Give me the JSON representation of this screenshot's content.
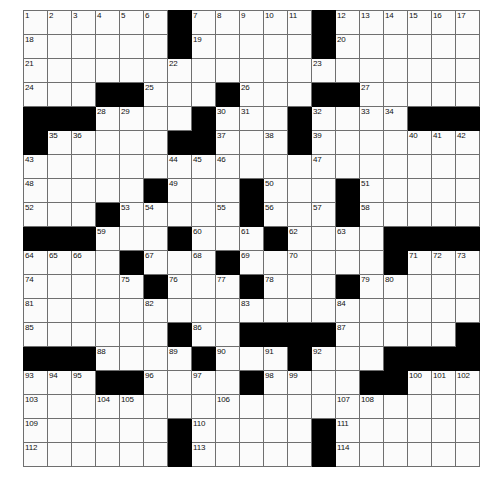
{
  "puzzle": {
    "title": "Crossword Grid",
    "rows": 19,
    "cols": 19,
    "cell_size_px": 23,
    "colors": {
      "block": "#000000",
      "cell": "#fbfbfb",
      "grid_line": "#6f6f6f",
      "number_text": "#111111"
    },
    "highest_number": 114,
    "blocks": [
      [
        1,
        7
      ],
      [
        1,
        13
      ],
      [
        2,
        7
      ],
      [
        2,
        13
      ],
      [
        4,
        4
      ],
      [
        4,
        5
      ],
      [
        4,
        9
      ],
      [
        4,
        13
      ],
      [
        4,
        14
      ],
      [
        5,
        1
      ],
      [
        5,
        2
      ],
      [
        5,
        3
      ],
      [
        5,
        8
      ],
      [
        5,
        12
      ],
      [
        5,
        17
      ],
      [
        5,
        18
      ],
      [
        5,
        19
      ],
      [
        6,
        1
      ],
      [
        6,
        7
      ],
      [
        6,
        8
      ],
      [
        6,
        12
      ],
      [
        8,
        6
      ],
      [
        8,
        10
      ],
      [
        8,
        14
      ],
      [
        9,
        4
      ],
      [
        9,
        10
      ],
      [
        9,
        14
      ],
      [
        10,
        1
      ],
      [
        10,
        2
      ],
      [
        10,
        3
      ],
      [
        10,
        7
      ],
      [
        10,
        11
      ],
      [
        10,
        16
      ],
      [
        10,
        17
      ],
      [
        10,
        18
      ],
      [
        10,
        19
      ],
      [
        11,
        5
      ],
      [
        11,
        9
      ],
      [
        11,
        16
      ],
      [
        12,
        6
      ],
      [
        12,
        10
      ],
      [
        12,
        14
      ],
      [
        14,
        7
      ],
      [
        14,
        10
      ],
      [
        14,
        11
      ],
      [
        14,
        12
      ],
      [
        14,
        13
      ],
      [
        14,
        19
      ],
      [
        15,
        1
      ],
      [
        15,
        2
      ],
      [
        15,
        3
      ],
      [
        15,
        8
      ],
      [
        15,
        12
      ],
      [
        15,
        16
      ],
      [
        15,
        17
      ],
      [
        15,
        18
      ],
      [
        15,
        19
      ],
      [
        16,
        4
      ],
      [
        16,
        5
      ],
      [
        16,
        10
      ],
      [
        16,
        15
      ],
      [
        16,
        16
      ],
      [
        18,
        7
      ],
      [
        18,
        13
      ],
      [
        19,
        7
      ],
      [
        19,
        13
      ]
    ],
    "numbers": [
      {
        "n": 1,
        "row": 1,
        "col": 1
      },
      {
        "n": 2,
        "row": 1,
        "col": 2
      },
      {
        "n": 3,
        "row": 1,
        "col": 3
      },
      {
        "n": 4,
        "row": 1,
        "col": 4
      },
      {
        "n": 5,
        "row": 1,
        "col": 5
      },
      {
        "n": 6,
        "row": 1,
        "col": 6
      },
      {
        "n": 7,
        "row": 1,
        "col": 8
      },
      {
        "n": 8,
        "row": 1,
        "col": 9
      },
      {
        "n": 9,
        "row": 1,
        "col": 10
      },
      {
        "n": 10,
        "row": 1,
        "col": 11
      },
      {
        "n": 11,
        "row": 1,
        "col": 12
      },
      {
        "n": 12,
        "row": 1,
        "col": 14
      },
      {
        "n": 13,
        "row": 1,
        "col": 15
      },
      {
        "n": 14,
        "row": 1,
        "col": 16
      },
      {
        "n": 15,
        "row": 1,
        "col": 17
      },
      {
        "n": 16,
        "row": 1,
        "col": 18
      },
      {
        "n": 17,
        "row": 1,
        "col": 19
      },
      {
        "n": 18,
        "row": 2,
        "col": 1
      },
      {
        "n": 19,
        "row": 2,
        "col": 8
      },
      {
        "n": 20,
        "row": 2,
        "col": 14
      },
      {
        "n": 21,
        "row": 3,
        "col": 1
      },
      {
        "n": 22,
        "row": 3,
        "col": 7
      },
      {
        "n": 23,
        "row": 3,
        "col": 13
      },
      {
        "n": 24,
        "row": 4,
        "col": 1
      },
      {
        "n": 25,
        "row": 4,
        "col": 6
      },
      {
        "n": 26,
        "row": 4,
        "col": 10
      },
      {
        "n": 27,
        "row": 4,
        "col": 15
      },
      {
        "n": 28,
        "row": 5,
        "col": 4
      },
      {
        "n": 29,
        "row": 5,
        "col": 5
      },
      {
        "n": 30,
        "row": 5,
        "col": 9
      },
      {
        "n": 31,
        "row": 5,
        "col": 10
      },
      {
        "n": 32,
        "row": 5,
        "col": 13
      },
      {
        "n": 33,
        "row": 5,
        "col": 15
      },
      {
        "n": 34,
        "row": 5,
        "col": 16
      },
      {
        "n": 35,
        "row": 6,
        "col": 2
      },
      {
        "n": 36,
        "row": 6,
        "col": 3
      },
      {
        "n": 37,
        "row": 6,
        "col": 9
      },
      {
        "n": 38,
        "row": 6,
        "col": 11
      },
      {
        "n": 39,
        "row": 6,
        "col": 13
      },
      {
        "n": 40,
        "row": 6,
        "col": 17
      },
      {
        "n": 41,
        "row": 6,
        "col": 18
      },
      {
        "n": 42,
        "row": 6,
        "col": 19
      },
      {
        "n": 43,
        "row": 7,
        "col": 1
      },
      {
        "n": 44,
        "row": 7,
        "col": 7
      },
      {
        "n": 45,
        "row": 7,
        "col": 8
      },
      {
        "n": 46,
        "row": 7,
        "col": 9
      },
      {
        "n": 47,
        "row": 7,
        "col": 13
      },
      {
        "n": 48,
        "row": 8,
        "col": 1
      },
      {
        "n": 49,
        "row": 8,
        "col": 7
      },
      {
        "n": 50,
        "row": 8,
        "col": 11
      },
      {
        "n": 51,
        "row": 8,
        "col": 15
      },
      {
        "n": 52,
        "row": 9,
        "col": 1
      },
      {
        "n": 53,
        "row": 9,
        "col": 5
      },
      {
        "n": 54,
        "row": 9,
        "col": 6
      },
      {
        "n": 55,
        "row": 9,
        "col": 9
      },
      {
        "n": 56,
        "row": 9,
        "col": 11
      },
      {
        "n": 57,
        "row": 9,
        "col": 13
      },
      {
        "n": 58,
        "row": 9,
        "col": 15
      },
      {
        "n": 59,
        "row": 10,
        "col": 4
      },
      {
        "n": 60,
        "row": 10,
        "col": 8
      },
      {
        "n": 61,
        "row": 10,
        "col": 10
      },
      {
        "n": 62,
        "row": 10,
        "col": 12
      },
      {
        "n": 63,
        "row": 10,
        "col": 14
      },
      {
        "n": 64,
        "row": 11,
        "col": 1
      },
      {
        "n": 65,
        "row": 11,
        "col": 2
      },
      {
        "n": 66,
        "row": 11,
        "col": 3
      },
      {
        "n": 67,
        "row": 11,
        "col": 6
      },
      {
        "n": 68,
        "row": 11,
        "col": 8
      },
      {
        "n": 69,
        "row": 11,
        "col": 10
      },
      {
        "n": 70,
        "row": 11,
        "col": 12
      },
      {
        "n": 71,
        "row": 11,
        "col": 17
      },
      {
        "n": 72,
        "row": 11,
        "col": 18
      },
      {
        "n": 73,
        "row": 11,
        "col": 19
      },
      {
        "n": 74,
        "row": 12,
        "col": 1
      },
      {
        "n": 75,
        "row": 12,
        "col": 5
      },
      {
        "n": 76,
        "row": 12,
        "col": 7
      },
      {
        "n": 77,
        "row": 12,
        "col": 9
      },
      {
        "n": 78,
        "row": 12,
        "col": 11
      },
      {
        "n": 79,
        "row": 12,
        "col": 15
      },
      {
        "n": 80,
        "row": 12,
        "col": 16
      },
      {
        "n": 81,
        "row": 13,
        "col": 1
      },
      {
        "n": 82,
        "row": 13,
        "col": 6
      },
      {
        "n": 83,
        "row": 13,
        "col": 10
      },
      {
        "n": 84,
        "row": 13,
        "col": 14
      },
      {
        "n": 85,
        "row": 14,
        "col": 1
      },
      {
        "n": 86,
        "row": 14,
        "col": 8
      },
      {
        "n": 87,
        "row": 14,
        "col": 14
      },
      {
        "n": 88,
        "row": 15,
        "col": 4
      },
      {
        "n": 89,
        "row": 15,
        "col": 7
      },
      {
        "n": 90,
        "row": 15,
        "col": 9
      },
      {
        "n": 91,
        "row": 15,
        "col": 11
      },
      {
        "n": 92,
        "row": 15,
        "col": 13
      },
      {
        "n": 93,
        "row": 16,
        "col": 1
      },
      {
        "n": 94,
        "row": 16,
        "col": 2
      },
      {
        "n": 95,
        "row": 16,
        "col": 3
      },
      {
        "n": 96,
        "row": 16,
        "col": 6
      },
      {
        "n": 97,
        "row": 16,
        "col": 8
      },
      {
        "n": 98,
        "row": 16,
        "col": 11
      },
      {
        "n": 99,
        "row": 16,
        "col": 12
      },
      {
        "n": 100,
        "row": 16,
        "col": 17
      },
      {
        "n": 101,
        "row": 16,
        "col": 18
      },
      {
        "n": 102,
        "row": 16,
        "col": 19
      },
      {
        "n": 103,
        "row": 17,
        "col": 1
      },
      {
        "n": 104,
        "row": 17,
        "col": 4
      },
      {
        "n": 105,
        "row": 17,
        "col": 5
      },
      {
        "n": 106,
        "row": 17,
        "col": 9
      },
      {
        "n": 107,
        "row": 17,
        "col": 14
      },
      {
        "n": 108,
        "row": 17,
        "col": 15
      },
      {
        "n": 109,
        "row": 18,
        "col": 1
      },
      {
        "n": 110,
        "row": 18,
        "col": 8
      },
      {
        "n": 111,
        "row": 18,
        "col": 14
      },
      {
        "n": 112,
        "row": 19,
        "col": 1
      },
      {
        "n": 113,
        "row": 19,
        "col": 8
      },
      {
        "n": 114,
        "row": 19,
        "col": 14
      }
    ]
  }
}
